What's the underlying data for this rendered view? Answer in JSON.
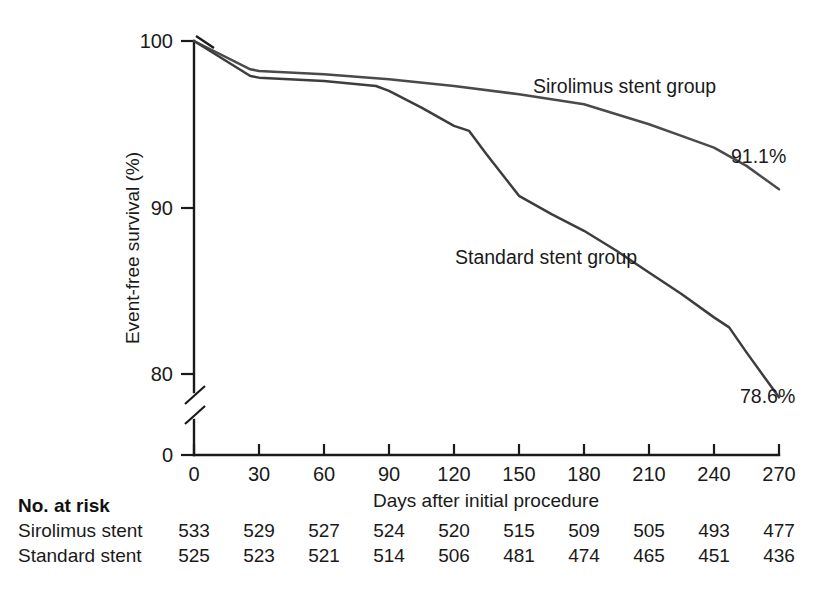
{
  "chart_data": {
    "type": "line",
    "title": "",
    "subtitle": "",
    "xlabel": "Days after initial procedure",
    "ylabel": "Event-free survival (%)",
    "xlim": [
      0,
      270
    ],
    "ylim": [
      80,
      100
    ],
    "y_axis_break": true,
    "y_axis_break_note": "axis broken between 80 and 0",
    "grid": false,
    "legend_position": "inline-annotations",
    "xticks": [
      0,
      30,
      60,
      90,
      120,
      150,
      180,
      210,
      240,
      270
    ],
    "xtick_labels": [
      "0",
      "30",
      "60",
      "90",
      "120",
      "150",
      "180",
      "210",
      "240",
      "270"
    ],
    "yticks": [
      0,
      80,
      90,
      100
    ],
    "ytick_labels": [
      "0",
      "80",
      "90",
      "100"
    ],
    "series": [
      {
        "name": "Sirolimus stent group",
        "color": "#4a4a4a",
        "label_text": "Sirolimus stent group",
        "endpoint_label": "91.1%",
        "x": [
          0,
          26,
          30,
          60,
          90,
          120,
          150,
          165,
          180,
          195,
          210,
          225,
          240,
          255,
          270
        ],
        "y": [
          100.0,
          98.3,
          98.2,
          98.0,
          97.7,
          97.3,
          96.8,
          96.5,
          96.2,
          95.6,
          95.0,
          94.3,
          93.6,
          92.5,
          91.1
        ]
      },
      {
        "name": "Standard stent group",
        "color": "#3d3d3d",
        "label_text": "Standard stent group",
        "endpoint_label": "78.6%",
        "x": [
          0,
          26,
          30,
          60,
          84,
          90,
          105,
          120,
          127,
          135,
          150,
          165,
          180,
          195,
          210,
          225,
          240,
          247,
          255,
          270
        ],
        "y": [
          100.0,
          97.9,
          97.8,
          97.6,
          97.3,
          97.0,
          96.0,
          94.9,
          94.6,
          93.2,
          90.7,
          89.6,
          88.6,
          87.4,
          86.1,
          84.8,
          83.4,
          82.8,
          81.3,
          78.6
        ]
      }
    ],
    "annotations": [
      {
        "text": "Sirolimus stent group",
        "x_px": 533,
        "y_px": 93
      },
      {
        "text": "Standard stent group",
        "x_px": 455,
        "y_px": 264
      },
      {
        "text": "91.1%",
        "x_px": 731,
        "y_px": 163
      },
      {
        "text": "78.6%",
        "x_px": 740,
        "y_px": 403
      }
    ]
  },
  "risk_table": {
    "heading": "No. at risk",
    "rows": [
      {
        "label": "Sirolimus stent",
        "values": [
          "533",
          "529",
          "527",
          "524",
          "520",
          "515",
          "509",
          "505",
          "493",
          "477"
        ]
      },
      {
        "label": "Standard stent",
        "values": [
          "525",
          "523",
          "521",
          "514",
          "506",
          "481",
          "474",
          "465",
          "451",
          "436"
        ]
      }
    ]
  },
  "colors": {
    "background": "#ffffff",
    "axis": "#1a1a1a",
    "sirolimus_curve": "#4a4a4a",
    "standard_curve": "#3d3d3d",
    "text": "#1a1a1a"
  }
}
